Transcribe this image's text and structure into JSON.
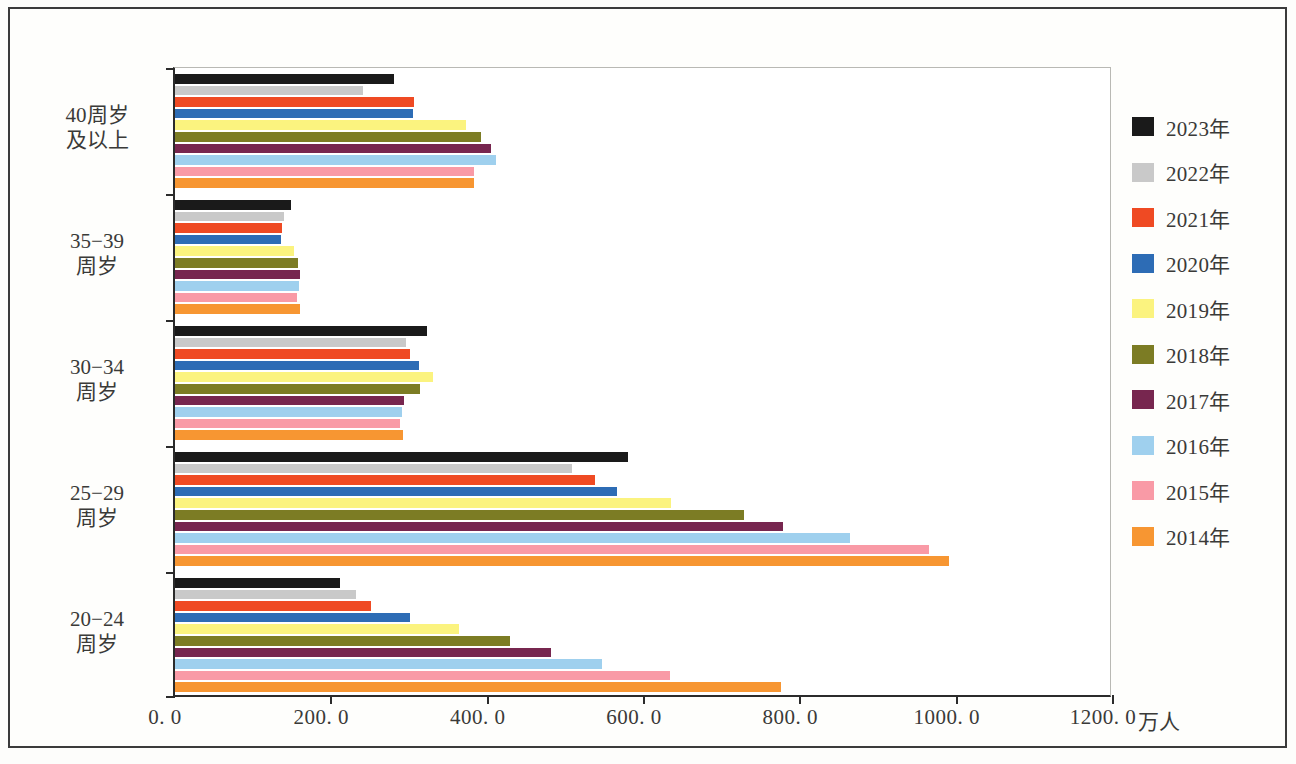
{
  "chart_data": {
    "type": "bar",
    "orientation": "horizontal",
    "title": "",
    "xlabel": "万人",
    "ylabel": "",
    "xlim": [
      0,
      1200
    ],
    "xticks": [
      "0. 0",
      "200. 0",
      "400. 0",
      "600. 0",
      "800. 0",
      "1000. 0",
      "1200. 0"
    ],
    "xtick_values": [
      0,
      200,
      400,
      600,
      800,
      1000,
      1200
    ],
    "grid": false,
    "legend_position": "right",
    "categories": [
      "40周岁\n及以上",
      "35−39\n周岁",
      "30−34\n周岁",
      "25−29\n周岁",
      "20−24\n周岁"
    ],
    "series": [
      {
        "name": "2023年",
        "color": "#1a1a1a",
        "values": [
          280,
          148,
          322,
          580,
          211
        ]
      },
      {
        "name": "2022年",
        "color": "#c9c9c9",
        "values": [
          241,
          140,
          296,
          508,
          232
        ]
      },
      {
        "name": "2021年",
        "color": "#ef4a23",
        "values": [
          306,
          137,
          301,
          537,
          251
        ]
      },
      {
        "name": "2020年",
        "color": "#2d6cb5",
        "values": [
          304,
          136,
          312,
          565,
          300
        ]
      },
      {
        "name": "2019年",
        "color": "#fbf37f",
        "values": [
          372,
          152,
          330,
          634,
          363
        ]
      },
      {
        "name": "2018年",
        "color": "#7c7c24",
        "values": [
          391,
          157,
          314,
          728,
          429
        ]
      },
      {
        "name": "2017年",
        "color": "#77264f",
        "values": [
          404,
          160,
          293,
          778,
          481
        ]
      },
      {
        "name": "2016年",
        "color": "#9fd0ee",
        "values": [
          411,
          158,
          290,
          863,
          546
        ]
      },
      {
        "name": "2015年",
        "color": "#f99aa6",
        "values": [
          383,
          156,
          288,
          965,
          633
        ]
      },
      {
        "name": "2014年",
        "color": "#f79632",
        "values": [
          382,
          160,
          292,
          990,
          775
        ]
      }
    ]
  },
  "axis": {
    "unit_label": "万人"
  }
}
